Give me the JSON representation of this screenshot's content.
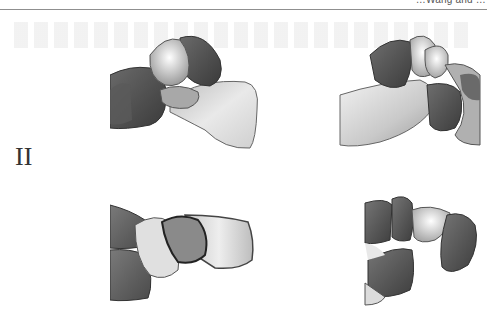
{
  "header": {
    "running_head": "…Wang and …",
    "rule_color": "#8f8f8f"
  },
  "figure": {
    "row_label": "II",
    "panels": [
      {
        "id": "top-left",
        "description": "3D bone render, lateral view of midfoot/hindfoot joint",
        "dark": "#4a4a4a",
        "mid": "#9a9a9a",
        "light": "#e8e8e8"
      },
      {
        "id": "top-right",
        "description": "3D bone render, medial view of midfoot/hindfoot joint",
        "dark": "#4a4a4a",
        "mid": "#9a9a9a",
        "light": "#e8e8e8"
      },
      {
        "id": "bottom-left",
        "description": "3D bone render, dorsal view of joint",
        "dark": "#4a4a4a",
        "mid": "#9a9a9a",
        "light": "#e8e8e8"
      },
      {
        "id": "bottom-right",
        "description": "3D bone render, anterior view of joint",
        "dark": "#4a4a4a",
        "mid": "#9a9a9a",
        "light": "#e8e8e8"
      }
    ]
  }
}
